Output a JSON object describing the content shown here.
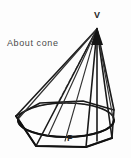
{
  "figure": {
    "kind": "geometry-diagram",
    "caption": "About  cone",
    "labels": {
      "apex": "V",
      "base_point": "P"
    },
    "colors": {
      "background": "#fdfdfd",
      "ink": "#1a1a1a",
      "thin_ink": "#333333",
      "hidden_ink": "#6e6e6e",
      "caption_ink": "#4a4a4a"
    },
    "geometry": {
      "apex": [
        97,
        28
      ],
      "base_center": [
        66,
        120
      ],
      "ellipse_rx": 48,
      "ellipse_ry": 17,
      "base_polygon_vertices": [
        [
          16,
          116
        ],
        [
          40,
          103
        ],
        [
          83,
          101
        ],
        [
          114,
          110
        ],
        [
          112,
          138
        ],
        [
          86,
          147
        ],
        [
          36,
          146
        ]
      ],
      "cone_base_point_P": [
        65,
        141
      ],
      "axis_visible": true,
      "hidden_lines_dashed": true
    },
    "elements": [
      "apex-point",
      "pyramid-lateral-edges",
      "cone-slant-lines",
      "cone-base-ellipse",
      "base-polygon",
      "cone-axis",
      "hidden-back-arc"
    ]
  }
}
